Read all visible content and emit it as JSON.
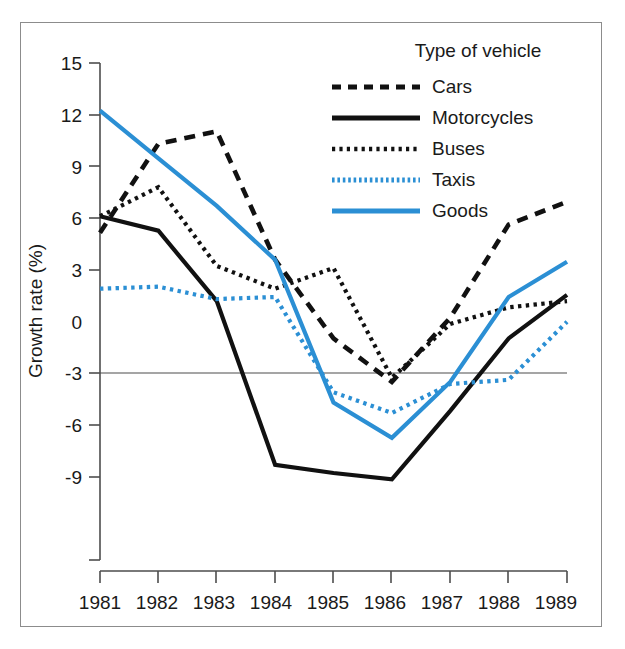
{
  "chart_data": {
    "type": "line",
    "title": "",
    "xlabel": "",
    "ylabel": "Growth rate (%)",
    "categories": [
      "1981",
      "1982",
      "1983",
      "1984",
      "1985",
      "1986",
      "1987",
      "1988",
      "1989"
    ],
    "x": [
      1981,
      1982,
      1983,
      1984,
      1985,
      1986,
      1987,
      1988,
      1989
    ],
    "xlim": [
      1981,
      1989
    ],
    "ylim": [
      -9,
      15
    ],
    "yticks": [
      15,
      12,
      9,
      6,
      3,
      0,
      -3,
      -6,
      -9
    ],
    "ytick_labels": [
      "15",
      "12",
      "9",
      "6",
      "3",
      "0",
      "-3",
      "-6",
      "-9"
    ],
    "grid": false,
    "zero_line": true,
    "legend_position": "top-right",
    "legend_title": "Type of vehicle",
    "series": [
      {
        "name": "Cars",
        "style": "dashed",
        "color": "#111111",
        "values": [
          6.8,
          11.1,
          11.7,
          5.5,
          1.7,
          -0.4,
          2.7,
          7.2,
          8.3
        ]
      },
      {
        "name": "Motorcycles",
        "style": "solid",
        "color": "#111111",
        "values": [
          7.6,
          6.9,
          3.5,
          -4.4,
          -4.8,
          -5.1,
          -1.8,
          1.7,
          3.8
        ]
      },
      {
        "name": "Buses",
        "style": "dotted",
        "color": "#111111",
        "values": [
          7.6,
          9.0,
          5.2,
          4.1,
          5.1,
          -0.2,
          2.4,
          3.2,
          3.5
        ]
      },
      {
        "name": "Taxis",
        "style": "dotted",
        "color": "#2b8fd4",
        "values": [
          4.1,
          4.2,
          3.6,
          3.7,
          -0.9,
          -1.9,
          -0.5,
          -0.3,
          2.5
        ]
      },
      {
        "name": "Goods",
        "style": "solid",
        "color": "#2b8fd4",
        "values": [
          12.7,
          10.4,
          8.1,
          5.5,
          -1.4,
          -3.1,
          -0.4,
          3.7,
          5.4
        ]
      }
    ]
  },
  "legend": {
    "title": "Type of vehicle",
    "items": [
      {
        "label": "Cars"
      },
      {
        "label": "Motorcycles"
      },
      {
        "label": "Buses"
      },
      {
        "label": "Taxis"
      },
      {
        "label": "Goods"
      }
    ]
  },
  "axes": {
    "y_label": "Growth rate (%)",
    "y_ticks": [
      "15",
      "12",
      "9",
      "6",
      "3",
      "0",
      "-3",
      "-6",
      "-9"
    ],
    "x_ticks": [
      "1981",
      "1982",
      "1983",
      "1984",
      "1985",
      "1986",
      "1987",
      "1988",
      "1989"
    ]
  },
  "colors": {
    "blue": "#2b8fd4",
    "black": "#111111",
    "frame": "#8c8c8c",
    "axis": "#4d4d4d",
    "background": "#ffffff"
  }
}
